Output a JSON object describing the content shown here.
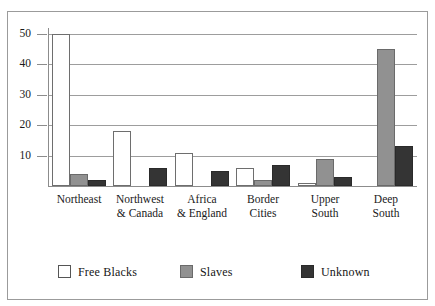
{
  "chart_data": {
    "type": "bar",
    "title": "",
    "subtitle": "",
    "xlabel": "",
    "ylabel": "",
    "ylim": [
      0,
      50
    ],
    "yticks": [
      10,
      20,
      30,
      40,
      50
    ],
    "ytick_labels": [
      "10",
      "20",
      "30",
      "40",
      "50"
    ],
    "grid": true,
    "legend_position": "bottom",
    "categories": [
      "Northeast",
      "Northwest & Canada",
      "Africa & England",
      "Border Cities",
      "Upper South",
      "Deep South"
    ],
    "category_lines": [
      [
        "Northeast",
        ""
      ],
      [
        "Northwest",
        "& Canada"
      ],
      [
        "Africa",
        "& England"
      ],
      [
        "Border",
        "Cities"
      ],
      [
        "Upper",
        "South"
      ],
      [
        "Deep",
        "South"
      ]
    ],
    "series": [
      {
        "name": "Free Blacks",
        "color": "#ffffff",
        "values": [
          50,
          18,
          11,
          6,
          1,
          0
        ]
      },
      {
        "name": "Slaves",
        "color": "#919191",
        "values": [
          4,
          0,
          0,
          2,
          9,
          45
        ]
      },
      {
        "name": "Unknown",
        "color": "#343434",
        "values": [
          2,
          6,
          5,
          7,
          3,
          13
        ]
      }
    ]
  },
  "legend": {
    "items": [
      {
        "label": "Free Blacks",
        "swatch": "free"
      },
      {
        "label": "Slaves",
        "swatch": "slaves"
      },
      {
        "label": "Unknown",
        "swatch": "unknown"
      }
    ]
  },
  "colors": {
    "free_blacks": "#ffffff",
    "slaves": "#919191",
    "unknown": "#343434",
    "axis": "#8c8c8c",
    "grid": "#9d9d9d",
    "frame": "#9b9b9b",
    "text": "#1a1a1a"
  }
}
